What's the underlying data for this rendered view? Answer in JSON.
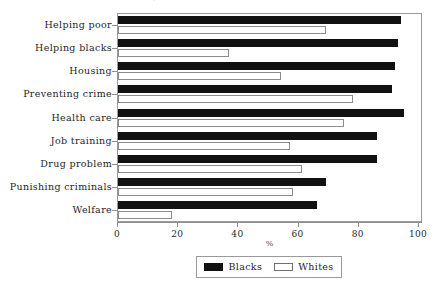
{
  "chart_data": {
    "type": "bar",
    "orientation": "horizontal",
    "title": "",
    "xlabel": "%",
    "ylabel": "",
    "xlim": [
      0,
      100
    ],
    "xticks": [
      0,
      20,
      40,
      60,
      80,
      100
    ],
    "grid": false,
    "legend_position": "bottom",
    "categories": [
      "Helping poor",
      "Helping blacks",
      "Housing",
      "Preventing crime",
      "Health care",
      "Job training",
      "Drug problem",
      "Punishing criminals",
      "Welfare"
    ],
    "series": [
      {
        "name": "Blacks",
        "color": "#111111",
        "values": [
          94,
          93,
          92,
          91,
          95,
          86,
          86,
          69,
          66
        ]
      },
      {
        "name": "Whites",
        "color": "#ffffff",
        "values": [
          69,
          37,
          54,
          78,
          75,
          57,
          61,
          58,
          18
        ]
      }
    ]
  },
  "axis": {
    "x_tick_labels": [
      "0",
      "20",
      "40",
      "60",
      "80",
      "100"
    ],
    "x_title": "%"
  },
  "legend": {
    "entries": [
      {
        "label": "Blacks",
        "swatch": "filled-black-swatch"
      },
      {
        "label": "Whites",
        "swatch": "hollow-white-swatch"
      }
    ]
  },
  "title_ghost": "·"
}
